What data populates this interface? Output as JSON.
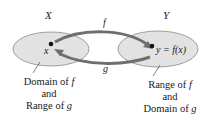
{
  "diagram": {
    "sets": [
      {
        "name": "X",
        "point_label": "x"
      },
      {
        "name": "Y",
        "point_label": "y = f(x)"
      }
    ],
    "arrows": [
      {
        "label": "f",
        "from": "X",
        "to": "Y"
      },
      {
        "label": "g",
        "from": "Y",
        "to": "X"
      }
    ],
    "captions": {
      "left": {
        "line1": "Domain of ",
        "line1_var": "f",
        "line2": "and",
        "line3": "Range of ",
        "line3_var": "g"
      },
      "right": {
        "line1": "Range of ",
        "line1_var": "f",
        "line2": "and",
        "line3": "Domain of ",
        "line3_var": "g"
      }
    },
    "colors": {
      "ellipse_fill": "#e2e2e2",
      "ellipse_stroke": "#8a8a8a",
      "arrow": "#6e6e6e",
      "text": "#1a1a1a"
    }
  }
}
